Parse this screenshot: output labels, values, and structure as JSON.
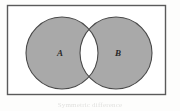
{
  "figure": {
    "type": "venn-diagram",
    "caption": "Symmetric difference",
    "universal_set_shape": "rectangle",
    "sets": [
      {
        "id": "A",
        "label": "A",
        "fill": "#a9a9a9",
        "stroke": "#4a4a4a"
      },
      {
        "id": "B",
        "label": "B",
        "fill": "#a9a9a9",
        "stroke": "#4a4a4a"
      }
    ],
    "shaded_region": "A Δ B (symmetric difference)",
    "unshaded_region": "A ∩ B (intersection)",
    "colors": {
      "background": "#fdfdfc",
      "shade": "#a9a9a9",
      "outline": "#4a4a4a",
      "frame": "#5a5a5a",
      "label": "#2a2a2a"
    },
    "geometry": {
      "frame": {
        "x": 7,
        "y": 5,
        "width": 159,
        "height": 90
      },
      "circle_a": {
        "cx": 62,
        "cy": 53,
        "r": 36
      },
      "circle_b": {
        "cx": 116,
        "cy": 53,
        "r": 36
      }
    }
  }
}
